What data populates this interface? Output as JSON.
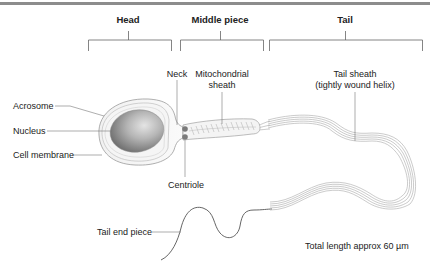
{
  "diagram": {
    "sections": [
      {
        "id": "head",
        "label": "Head"
      },
      {
        "id": "middle",
        "label": "Middle piece"
      },
      {
        "id": "tail",
        "label": "Tail"
      }
    ],
    "labels": {
      "neck": "Neck",
      "mitochondrial_sheath_line1": "Mitochondrial",
      "mitochondrial_sheath_line2": "sheath",
      "tail_sheath_line1": "Tail sheath",
      "tail_sheath_line2": "(tightly wound helix)",
      "acrosome": "Acrosome",
      "nucleus": "Nucleus",
      "cell_membrane": "Cell membrane",
      "centriole": "Centriole",
      "tail_end_piece": "Tail end piece",
      "total_length": "Total length approx 60 µm"
    },
    "colors": {
      "line": "#555555",
      "outline": "#9a9a9a",
      "nucleus_dark": "#6e6e6e",
      "nucleus_light": "#d8d8d8",
      "centriole": "#777777",
      "top_rule": "#8c8c8c"
    }
  }
}
